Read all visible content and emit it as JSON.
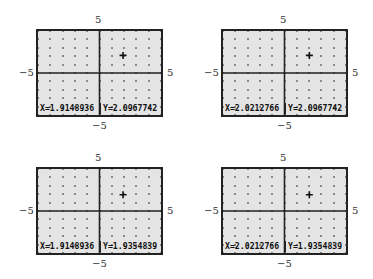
{
  "window": {
    "xmin": -5,
    "xmax": 5,
    "ymin": -5,
    "ymax": 5,
    "xscl": 1,
    "yscl": 1
  },
  "colors": {
    "screen_bg": "#e4e4e4",
    "axis": "#222222",
    "dot": "#444444",
    "text": "#111111"
  },
  "panels": [
    {
      "labels": {
        "top": "5",
        "bottom": "−5",
        "left": "−5",
        "right": "5"
      },
      "cursor": {
        "x": 1.9148936,
        "y": 2.0967742
      },
      "readout": {
        "x": "X=1.9148936",
        "y": "Y=2.0967742"
      }
    },
    {
      "labels": {
        "top": "5",
        "bottom": "−5",
        "left": "−5",
        "right": "5"
      },
      "cursor": {
        "x": 2.0212766,
        "y": 2.0967742
      },
      "readout": {
        "x": "X=2.0212766",
        "y": "Y=2.0967742"
      }
    },
    {
      "labels": {
        "top": "5",
        "bottom": "−5",
        "left": "−5",
        "right": "5"
      },
      "cursor": {
        "x": 1.9148936,
        "y": 1.9354839
      },
      "readout": {
        "x": "X=1.9148936",
        "y": "Y=1.9354839"
      }
    },
    {
      "labels": {
        "top": "5",
        "bottom": "−5",
        "left": "−5",
        "right": "5"
      },
      "cursor": {
        "x": 2.0212766,
        "y": 1.9354839
      },
      "readout": {
        "x": "X=2.0212766",
        "y": "Y=1.9354839"
      }
    }
  ]
}
